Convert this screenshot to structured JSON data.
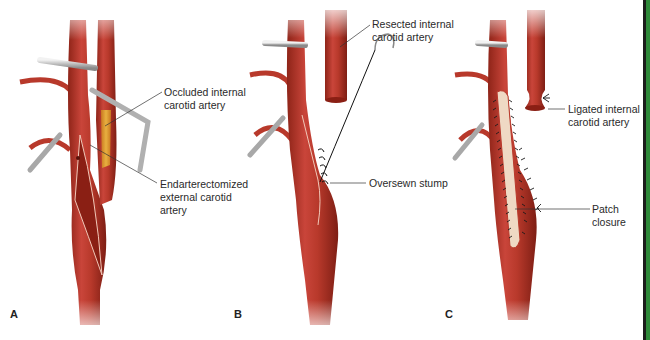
{
  "figure": {
    "panels": [
      {
        "letter": "A",
        "labels": [
          {
            "line1": "Occluded internal",
            "line2": "carotid artery"
          },
          {
            "line1": "Endarterectomized",
            "line2": "external carotid",
            "line3": "artery"
          }
        ]
      },
      {
        "letter": "B",
        "labels": [
          {
            "line1": "Resected internal",
            "line2": "carotid artery"
          },
          {
            "line1": "Oversewn stump"
          }
        ]
      },
      {
        "letter": "C",
        "labels": [
          {
            "line1": "Ligated internal",
            "line2": "carotid artery"
          },
          {
            "line1": "Patch",
            "line2": "closure"
          }
        ]
      }
    ],
    "colors": {
      "artery": "#b8392b",
      "artery_dark": "#8e2418",
      "artery_light": "#d9685a",
      "plaque": "#e0a030",
      "clamp": "#c9c9c9",
      "patch": "#efd9c4",
      "suture": "#222222",
      "side_bar": "#2f8a3a"
    }
  }
}
